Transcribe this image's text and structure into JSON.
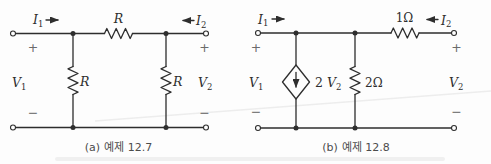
{
  "figure": {
    "type": "circuit-diagram-pair",
    "ink_color": "#2e2e2e",
    "paper_color": "#fdfdfd",
    "caption_color": "#4c4c4c"
  },
  "circuit_a": {
    "caption_index": "(a)",
    "caption_text": "예제 12.7",
    "labels": {
      "i1": {
        "base": "I",
        "sub": "1"
      },
      "i2": {
        "base": "I",
        "sub": "2"
      },
      "v1": {
        "base": "V",
        "sub": "1"
      },
      "v2": {
        "base": "V",
        "sub": "2"
      },
      "r_top": "R",
      "r_left": "R",
      "r_right": "R",
      "plus_left": "+",
      "minus_left": "−",
      "plus_right": "+",
      "minus_right": "−"
    }
  },
  "circuit_b": {
    "caption_index": "(b)",
    "caption_text": "예제 12.8",
    "labels": {
      "i1": {
        "base": "I",
        "sub": "1"
      },
      "i2": {
        "base": "I",
        "sub": "2"
      },
      "v1": {
        "base": "V",
        "sub": "1"
      },
      "v2": {
        "base": "V",
        "sub": "2"
      },
      "dep_source": {
        "coeff": "2 ",
        "base": "V",
        "sub": "2"
      },
      "r_series": "1Ω",
      "r_shunt": "2Ω",
      "plus_left": "+",
      "minus_left": "−",
      "plus_right": "+",
      "minus_right": "−"
    }
  }
}
